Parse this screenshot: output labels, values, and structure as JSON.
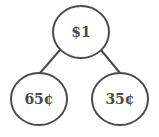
{
  "diagram": {
    "type": "number-bond",
    "whole": {
      "label": "$1"
    },
    "parts": [
      {
        "label": "65¢"
      },
      {
        "label": "35¢"
      }
    ],
    "colors": {
      "stroke": "#4a4a4a",
      "text": "#4a4a4a",
      "background": "#ffffff"
    }
  }
}
